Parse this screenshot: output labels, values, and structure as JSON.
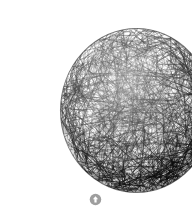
{
  "page": {
    "background_color": "#ffffff",
    "width": 192,
    "height": 210,
    "caption": ""
  },
  "figure": {
    "name": "wire-sphere",
    "stroke_color": "#0d0d0d",
    "rim_color": "#000000",
    "interior_color": "#2a2a2a",
    "bounds": {
      "x": 19,
      "y": 11,
      "width": 155,
      "height": 167
    }
  },
  "controls": {
    "scroll_top": {
      "icon": "arrow-up-circle-icon",
      "label": "",
      "color": "#9e9e9e",
      "arrow_color": "#ffffff"
    }
  },
  "render_params": {
    "chord_count": 900,
    "rim_chord_count": 520,
    "seed": 20240517,
    "min_stroke_width": 0.35,
    "max_stroke_width": 1.15
  }
}
